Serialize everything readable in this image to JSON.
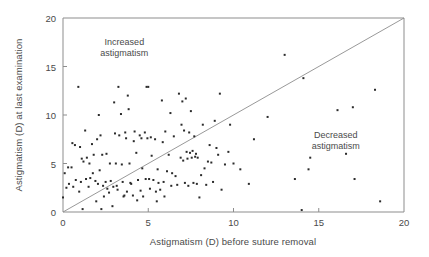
{
  "chart_data": {
    "type": "scatter",
    "title": "",
    "xlabel": "Astigmatism (D) before suture removal",
    "ylabel": "Astigmatism (D) at last examination",
    "xlim": [
      0,
      20
    ],
    "ylim": [
      0,
      20
    ],
    "xticks": [
      0,
      5,
      10,
      15,
      20
    ],
    "yticks": [
      0,
      5,
      10,
      15,
      20
    ],
    "xtick_labels": [
      "0",
      "5",
      "10",
      "15",
      "20"
    ],
    "ytick_labels": [
      "0",
      "5",
      "10",
      "15",
      "20"
    ],
    "grid": false,
    "legend": null,
    "marker": "square",
    "marker_color": "#2b2b2b",
    "frame_color": "#8d8d8d",
    "reference_line": {
      "name": "identity-line",
      "equation": "y = x",
      "from": [
        0,
        0
      ],
      "to": [
        20,
        20
      ],
      "color": "#8d8d8d"
    },
    "annotations": [
      {
        "name": "increased-astigmatism-label",
        "line1": "Increased",
        "line2": "astigmatism",
        "x": 3.6,
        "y": 17.2
      },
      {
        "name": "decreased-astigmatism-label",
        "line1": "Decreased",
        "line2": "astigmatism",
        "x": 16.0,
        "y": 7.6
      }
    ],
    "points": [
      [
        0.0,
        1.5
      ],
      [
        0.1,
        4.0
      ],
      [
        0.2,
        2.5
      ],
      [
        0.3,
        4.6
      ],
      [
        0.35,
        2.9
      ],
      [
        0.5,
        4.6
      ],
      [
        0.55,
        7.1
      ],
      [
        0.6,
        2.6
      ],
      [
        0.7,
        6.9
      ],
      [
        0.75,
        3.3
      ],
      [
        0.9,
        12.9
      ],
      [
        0.95,
        2.1
      ],
      [
        1.0,
        6.7
      ],
      [
        1.05,
        3.1
      ],
      [
        1.1,
        5.5
      ],
      [
        1.15,
        0.3
      ],
      [
        1.2,
        5.2
      ],
      [
        1.3,
        8.4
      ],
      [
        1.35,
        3.4
      ],
      [
        1.4,
        5.6
      ],
      [
        1.5,
        2.6
      ],
      [
        1.55,
        5.0
      ],
      [
        1.6,
        3.5
      ],
      [
        1.7,
        7.0
      ],
      [
        1.75,
        4.0
      ],
      [
        1.8,
        5.9
      ],
      [
        1.9,
        3.2
      ],
      [
        1.95,
        1.1
      ],
      [
        2.0,
        7.5
      ],
      [
        2.05,
        2.9
      ],
      [
        2.1,
        10.0
      ],
      [
        2.15,
        4.3
      ],
      [
        2.2,
        7.9
      ],
      [
        2.25,
        0.3
      ],
      [
        2.3,
        5.9
      ],
      [
        2.35,
        2.7
      ],
      [
        2.4,
        1.6
      ],
      [
        2.5,
        3.1
      ],
      [
        2.55,
        6.0
      ],
      [
        2.6,
        2.4
      ],
      [
        2.7,
        2.0
      ],
      [
        2.75,
        5.0
      ],
      [
        2.8,
        3.2
      ],
      [
        2.9,
        0.6
      ],
      [
        2.95,
        2.6
      ],
      [
        3.0,
        11.3
      ],
      [
        3.05,
        8.1
      ],
      [
        3.1,
        5.0
      ],
      [
        3.15,
        2.7
      ],
      [
        3.2,
        2.3
      ],
      [
        3.25,
        12.9
      ],
      [
        3.3,
        7.9
      ],
      [
        3.4,
        10.1
      ],
      [
        3.45,
        4.9
      ],
      [
        3.5,
        3.1
      ],
      [
        3.55,
        1.6
      ],
      [
        3.6,
        1.7
      ],
      [
        3.65,
        8.2
      ],
      [
        3.7,
        7.6
      ],
      [
        3.75,
        2.1
      ],
      [
        3.8,
        12.0
      ],
      [
        3.85,
        10.6
      ],
      [
        3.9,
        5.0
      ],
      [
        3.95,
        3.0
      ],
      [
        4.0,
        2.9
      ],
      [
        4.1,
        1.7
      ],
      [
        4.15,
        7.3
      ],
      [
        4.2,
        8.3
      ],
      [
        4.3,
        6.1
      ],
      [
        4.35,
        1.2
      ],
      [
        4.4,
        3.3
      ],
      [
        4.5,
        7.9
      ],
      [
        4.55,
        2.2
      ],
      [
        4.6,
        7.6
      ],
      [
        4.65,
        4.5
      ],
      [
        4.7,
        1.6
      ],
      [
        4.8,
        8.2
      ],
      [
        4.85,
        3.4
      ],
      [
        4.9,
        12.9
      ],
      [
        4.95,
        7.6
      ],
      [
        5.0,
        12.9
      ],
      [
        5.05,
        3.4
      ],
      [
        5.1,
        2.4
      ],
      [
        5.15,
        7.7
      ],
      [
        5.2,
        5.8
      ],
      [
        5.3,
        3.3
      ],
      [
        5.4,
        7.5
      ],
      [
        5.45,
        2.1
      ],
      [
        5.5,
        1.1
      ],
      [
        5.55,
        4.4
      ],
      [
        5.6,
        3.0
      ],
      [
        5.7,
        2.3
      ],
      [
        5.8,
        11.5
      ],
      [
        5.85,
        7.2
      ],
      [
        5.9,
        3.1
      ],
      [
        5.95,
        1.6
      ],
      [
        6.0,
        8.3
      ],
      [
        6.1,
        4.2
      ],
      [
        6.2,
        5.9
      ],
      [
        6.3,
        10.2
      ],
      [
        6.35,
        2.7
      ],
      [
        6.4,
        4.0
      ],
      [
        6.5,
        7.8
      ],
      [
        6.6,
        3.7
      ],
      [
        6.7,
        2.8
      ],
      [
        6.8,
        12.2
      ],
      [
        6.9,
        5.6
      ],
      [
        6.95,
        9.0
      ],
      [
        7.0,
        11.4
      ],
      [
        7.05,
        5.3
      ],
      [
        7.1,
        8.4
      ],
      [
        7.15,
        3.0
      ],
      [
        7.2,
        11.7
      ],
      [
        7.25,
        6.2
      ],
      [
        7.3,
        5.5
      ],
      [
        7.35,
        2.7
      ],
      [
        7.4,
        8.2
      ],
      [
        7.45,
        6.1
      ],
      [
        7.5,
        10.4
      ],
      [
        7.55,
        5.6
      ],
      [
        7.6,
        6.3
      ],
      [
        7.65,
        3.0
      ],
      [
        7.7,
        7.8
      ],
      [
        7.75,
        5.7
      ],
      [
        7.8,
        6.0
      ],
      [
        7.85,
        2.9
      ],
      [
        7.9,
        5.6
      ],
      [
        8.0,
        1.5
      ],
      [
        8.1,
        3.8
      ],
      [
        8.2,
        9.0
      ],
      [
        8.3,
        4.5
      ],
      [
        8.4,
        2.8
      ],
      [
        8.5,
        5.2
      ],
      [
        8.6,
        6.9
      ],
      [
        8.7,
        5.1
      ],
      [
        8.8,
        3.1
      ],
      [
        8.9,
        9.4
      ],
      [
        9.0,
        6.6
      ],
      [
        9.1,
        5.9
      ],
      [
        9.2,
        12.2
      ],
      [
        9.3,
        2.3
      ],
      [
        9.5,
        4.9
      ],
      [
        9.7,
        6.2
      ],
      [
        9.8,
        9.0
      ],
      [
        10.0,
        5.0
      ],
      [
        10.4,
        4.4
      ],
      [
        10.9,
        2.9
      ],
      [
        11.2,
        7.5
      ],
      [
        12.0,
        9.8
      ],
      [
        13.0,
        16.2
      ],
      [
        13.6,
        3.4
      ],
      [
        14.0,
        0.2
      ],
      [
        14.1,
        13.8
      ],
      [
        14.4,
        4.4
      ],
      [
        14.5,
        5.6
      ],
      [
        16.1,
        10.5
      ],
      [
        16.6,
        6.0
      ],
      [
        17.0,
        10.8
      ],
      [
        17.1,
        3.4
      ],
      [
        18.3,
        12.6
      ],
      [
        18.6,
        1.1
      ]
    ]
  }
}
